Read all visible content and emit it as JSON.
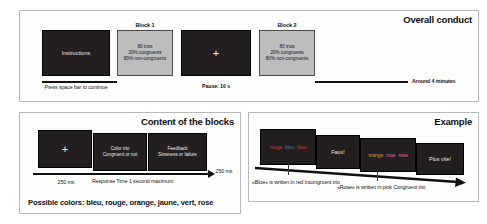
{
  "panels": {
    "overall": {
      "title": "Overall conduct",
      "instructions_screen": "Instructions",
      "instructions_caption_line1": "Press space bar",
      "instructions_caption_line2": "to continue",
      "block1_label": "Block 1",
      "block2_label": "Block 2",
      "block_trials": "80 trios",
      "block_congruent": "20% congruents",
      "block_noncongruent": "80% non-congruents",
      "pause_screen_glyph": "+",
      "pause_caption": "Pause: 10 s",
      "duration_caption": "Around 4 minutes"
    },
    "blocks": {
      "title": "Content of the blocks",
      "fixation_glyph": "+",
      "stim_line1": "Color trio",
      "stim_line2": "Congruent or not",
      "feedback_line1": "Feedback",
      "feedback_line2": "Slowness or failure",
      "time_fixation": "250 ms",
      "time_response_line1": "Response Time",
      "time_response_line2": "1 second maximum",
      "time_feedback": "250 ms",
      "possible_colors": "Possible colors: bleu, rouge, orange, jaune, vert, rose"
    },
    "example": {
      "title": "Example",
      "trio1": [
        {
          "text": "rouge",
          "color": "#cf3a33"
        },
        {
          "text": "bleu",
          "color": "#3f6fbf"
        },
        {
          "text": "bleu",
          "color": "#cf3a33"
        }
      ],
      "feedback1": "Faux!",
      "trio2": [
        {
          "text": "orange",
          "color": "#e08a2e"
        },
        {
          "text": "rose",
          "color": "#e060a8"
        },
        {
          "text": "rose",
          "color": "#e060a8"
        }
      ],
      "feedback2": "Plus vite!",
      "note1_line1": "«Blue» is written in red",
      "note1_line2": "Incongruent trio",
      "note2_line1": "«Rose» is written in pink",
      "note2_line2": "Congruent trio"
    }
  },
  "colors": {
    "screen_dark": "#231f20",
    "screen_grey": "#bdbdbd",
    "panel_border": "#b9b9b9",
    "ink": "#111111"
  }
}
